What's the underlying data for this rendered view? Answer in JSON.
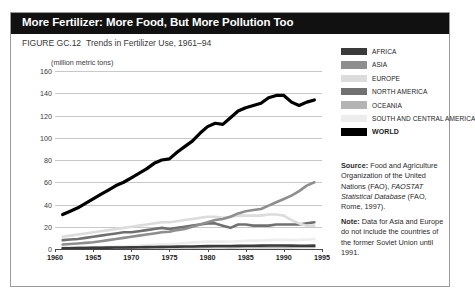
{
  "header": {
    "title": "More Fertilizer: More Food, But More Pollution Too",
    "figure_number": "FIGURE GC.12",
    "caption": "Trends in Fertilizer Use, 1961–94"
  },
  "legend": {
    "items": [
      {
        "label": "AFRICA",
        "color": "#3a3a3a"
      },
      {
        "label": "ASIA",
        "color": "#8e8e8e"
      },
      {
        "label": "EUROPE",
        "color": "#dcdcdc"
      },
      {
        "label": "NORTH AMERICA",
        "color": "#707070"
      },
      {
        "label": "OCEANIA",
        "color": "#b4b4b4"
      },
      {
        "label": "SOUTH AND CENTRAL AMERICA",
        "color": "#ededed"
      },
      {
        "label": "WORLD",
        "color": "#000000"
      }
    ]
  },
  "notes": {
    "source_label": "Source:",
    "source_text": "Food and Agriculture Organization of the United Nations (FAO),",
    "source_italic": "FAOSTAT Statistical Database",
    "source_tail": "(FAO, Rome, 1997).",
    "note_label": "Note:",
    "note_text": "Data for Asia and Europe do not include the countries of the former Soviet Union until 1991."
  },
  "chart_data": {
    "type": "line",
    "title": "Trends in Fertilizer Use, 1961–94",
    "xlabel": "",
    "ylabel": "(million metric tons)",
    "units": "(million metric tons)",
    "xlim": [
      1960,
      1995
    ],
    "ylim": [
      0,
      160
    ],
    "yticks": [
      0,
      20,
      40,
      60,
      80,
      100,
      120,
      140,
      160
    ],
    "xticks": [
      1960,
      1965,
      1970,
      1975,
      1980,
      1985,
      1990,
      1995
    ],
    "grid": true,
    "legend_position": "right",
    "x": [
      1961,
      1962,
      1963,
      1964,
      1965,
      1966,
      1967,
      1968,
      1969,
      1970,
      1971,
      1972,
      1973,
      1974,
      1975,
      1976,
      1977,
      1978,
      1979,
      1980,
      1981,
      1982,
      1983,
      1984,
      1985,
      1986,
      1987,
      1988,
      1989,
      1990,
      1991,
      1992,
      1993,
      1994
    ],
    "series": [
      {
        "name": "WORLD",
        "color": "#000000",
        "values": [
          31,
          34,
          37,
          41,
          45,
          49,
          53,
          57,
          60,
          64,
          68,
          72,
          77,
          80,
          81,
          87,
          92,
          97,
          104,
          110,
          113,
          112,
          118,
          124,
          127,
          129,
          131,
          136,
          138,
          138,
          132,
          129,
          132,
          134
        ]
      },
      {
        "name": "ASIA",
        "color": "#8e8e8e",
        "values": [
          4,
          4.5,
          5,
          5.5,
          6,
          7,
          8,
          9,
          10,
          11,
          12,
          13,
          14,
          15,
          15.5,
          17,
          18,
          20,
          22,
          24,
          26,
          27,
          29,
          32,
          34,
          35,
          36,
          39,
          42,
          45,
          48,
          52,
          57,
          60
        ]
      },
      {
        "name": "EUROPE",
        "color": "#dcdcdc",
        "values": [
          11,
          12,
          13,
          14,
          15,
          16,
          17,
          18,
          19,
          20,
          21,
          22,
          23,
          24,
          24,
          25,
          26,
          27,
          28,
          29,
          29,
          28,
          29,
          30,
          30,
          30,
          30,
          31,
          31,
          30,
          26,
          23,
          21,
          21
        ]
      },
      {
        "name": "NORTH AMERICA",
        "color": "#707070",
        "values": [
          8,
          8.5,
          9,
          10,
          11,
          12,
          13,
          14,
          15,
          15,
          16,
          17,
          18,
          19,
          18,
          19,
          20,
          21,
          22,
          23,
          23,
          21,
          19,
          22,
          22,
          21,
          21,
          21,
          22,
          22,
          22,
          22,
          23,
          24
        ]
      },
      {
        "name": "AFRICA",
        "color": "#3a3a3a",
        "values": [
          0.6,
          0.7,
          0.8,
          0.9,
          1.0,
          1.1,
          1.2,
          1.3,
          1.4,
          1.5,
          1.6,
          1.7,
          1.8,
          1.9,
          2.0,
          2.1,
          2.2,
          2.3,
          2.5,
          2.6,
          2.7,
          2.7,
          2.7,
          2.8,
          2.9,
          2.9,
          3.0,
          3.1,
          3.2,
          3.2,
          3.0,
          2.9,
          2.9,
          3.0
        ]
      },
      {
        "name": "SOUTH AND CENTRAL AMERICA",
        "color": "#ededed",
        "values": [
          0.8,
          0.9,
          1.0,
          1.2,
          1.4,
          1.6,
          1.9,
          2.2,
          2.5,
          2.8,
          3.1,
          3.5,
          3.9,
          4.3,
          4.5,
          4.9,
          5.3,
          5.7,
          6.2,
          6.6,
          6.8,
          6.6,
          6.5,
          7.0,
          7.3,
          7.5,
          7.7,
          8.0,
          8.2,
          8.3,
          8.0,
          8.2,
          8.6,
          9.0
        ]
      },
      {
        "name": "OCEANIA",
        "color": "#b4b4b4",
        "values": [
          0.9,
          0.95,
          1.0,
          1.1,
          1.2,
          1.25,
          1.3,
          1.3,
          1.25,
          1.3,
          1.3,
          1.35,
          1.4,
          1.4,
          1.3,
          1.35,
          1.4,
          1.45,
          1.5,
          1.55,
          1.6,
          1.55,
          1.5,
          1.6,
          1.6,
          1.6,
          1.6,
          1.65,
          1.7,
          1.7,
          1.7,
          1.75,
          1.8,
          1.85
        ]
      }
    ]
  }
}
